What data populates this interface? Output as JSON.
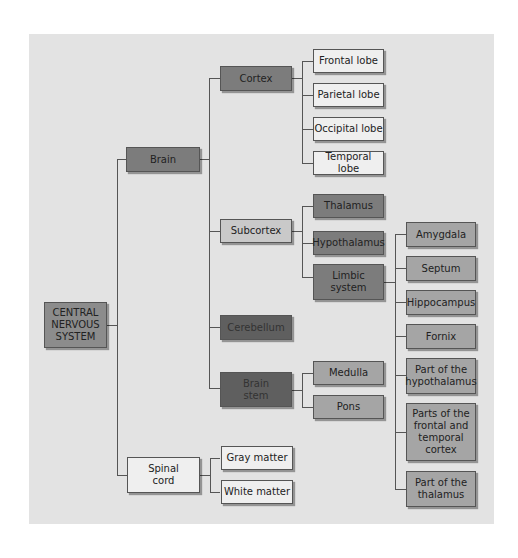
{
  "diagram": {
    "root": "CENTRAL NERVOUS SYSTEM",
    "root_lines": [
      "CENTRAL",
      "NERVOUS",
      "SYSTEM"
    ],
    "brain": "Brain",
    "cortex": "Cortex",
    "lobes": [
      "Frontal lobe",
      "Parietal lobe",
      "Occipital lobe",
      "Temporal lobe"
    ],
    "subcortex": "Subcortex",
    "thalamus": "Thalamus",
    "hypothalamus": "Hypothalamus",
    "limbic_lines": [
      "Limbic",
      "system"
    ],
    "limbic_parts": [
      {
        "lines": [
          "Amygdala"
        ]
      },
      {
        "lines": [
          "Septum"
        ]
      },
      {
        "lines": [
          "Hippocampus"
        ]
      },
      {
        "lines": [
          "Fornix"
        ]
      },
      {
        "lines": [
          "Part of the",
          "hypothalamus"
        ]
      },
      {
        "lines": [
          "Parts of the",
          "frontal and",
          "temporal",
          "cortex"
        ]
      },
      {
        "lines": [
          "Part of the",
          "thalamus"
        ]
      }
    ],
    "cerebellum": "Cerebellum",
    "brainstem_lines": [
      "Brain",
      "stem"
    ],
    "medulla": "Medulla",
    "pons": "Pons",
    "spinal_lines": [
      "Spinal",
      "cord"
    ],
    "gray_matter": "Gray matter",
    "white_matter": "White matter"
  },
  "colors": {
    "background": "#e3e3e3",
    "white_box": "#efefef",
    "light_box": "#c9c9c9",
    "mid_box": "#a5a5a5",
    "dark_box": "#7c7c7c",
    "darkest_box": "#5f5f5f",
    "line": "#555555"
  }
}
